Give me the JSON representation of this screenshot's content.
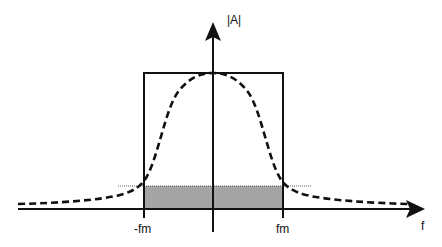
{
  "diagram": {
    "y_axis_label": "|A|",
    "x_axis_label": "f",
    "tick_labels": [
      "-fm",
      "fm"
    ],
    "elements": [
      {
        "type": "rectangle",
        "description": "ideal band-limited spectrum from -fm to fm"
      },
      {
        "type": "dashed-curve",
        "description": "bell-shaped actual spectrum"
      },
      {
        "type": "shaded-region",
        "description": "grey area between -fm and fm below threshold level"
      },
      {
        "type": "dotted-line",
        "description": "threshold level line"
      }
    ],
    "colors": {
      "line": "#111111",
      "shade": "#a8a8a8"
    }
  }
}
